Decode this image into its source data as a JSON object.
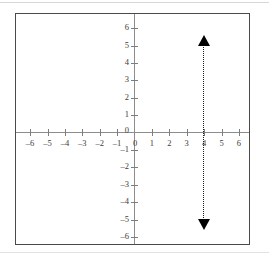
{
  "figure": {
    "name": "coordinate-plane-graph",
    "background_color": "#ffffff",
    "frame_color": "#4a4a4a",
    "axis_color": "#8d8d8d",
    "label_color": "#3d3d3d",
    "plot_color": "#000000"
  },
  "axes": {
    "x_label_text": "",
    "y_label_text": "",
    "origin_label": "0",
    "y_zero_label": "0",
    "x_ticks": [
      {
        "value": -6,
        "label": "–6"
      },
      {
        "value": -5,
        "label": "–5"
      },
      {
        "value": -4,
        "label": "–4"
      },
      {
        "value": -3,
        "label": "–3"
      },
      {
        "value": -2,
        "label": "–2"
      },
      {
        "value": -1,
        "label": "–1"
      },
      {
        "value": 1,
        "label": "1"
      },
      {
        "value": 2,
        "label": "2"
      },
      {
        "value": 3,
        "label": "3"
      },
      {
        "value": 4,
        "label": "4"
      },
      {
        "value": 5,
        "label": "5"
      },
      {
        "value": 6,
        "label": "6"
      }
    ],
    "y_ticks": [
      {
        "value": 6,
        "label": "6"
      },
      {
        "value": 5,
        "label": "5"
      },
      {
        "value": 4,
        "label": "4"
      },
      {
        "value": 3,
        "label": "3"
      },
      {
        "value": 2,
        "label": "2"
      },
      {
        "value": 1,
        "label": "1"
      },
      {
        "value": -1,
        "label": "–1"
      },
      {
        "value": -2,
        "label": "–2"
      },
      {
        "value": -3,
        "label": "–3"
      },
      {
        "value": -4,
        "label": "–4"
      },
      {
        "value": -5,
        "label": "–5"
      },
      {
        "value": -6,
        "label": "–6"
      }
    ]
  },
  "chart_data": {
    "type": "line",
    "title": "",
    "subtitle": "",
    "xlabel": "",
    "ylabel": "",
    "xlim": [
      -6.8,
      6.8
    ],
    "ylim": [
      -6.8,
      6.8
    ],
    "xticks": [
      -6,
      -5,
      -4,
      -3,
      -2,
      -1,
      0,
      1,
      2,
      3,
      4,
      5,
      6
    ],
    "yticks": [
      -6,
      -5,
      -4,
      -3,
      -2,
      -1,
      0,
      1,
      2,
      3,
      4,
      5,
      6
    ],
    "grid": false,
    "legend": null,
    "annotations": [],
    "series": [
      {
        "name": "x = 4",
        "equation": "x = 4",
        "style": "dotted",
        "color": "#000000",
        "orientation": "vertical",
        "x_intercept": 4,
        "x": [
          4,
          4
        ],
        "y": [
          -5.5,
          5.5
        ],
        "arrow_start": true,
        "arrow_end": true,
        "arrow_top_at": {
          "x": 4,
          "y": 5.5
        },
        "arrow_bottom_at": {
          "x": 4,
          "y": -5.5
        }
      }
    ]
  }
}
